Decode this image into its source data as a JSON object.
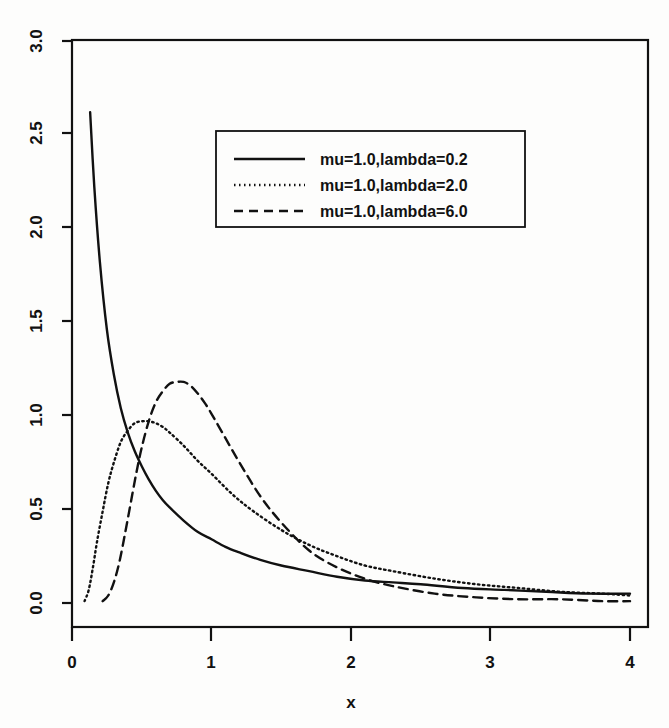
{
  "chart_data": {
    "type": "line",
    "title": "",
    "xlabel": "x",
    "ylabel": "",
    "xlim": [
      0,
      4
    ],
    "ylim": [
      0,
      3.0
    ],
    "grid": false,
    "legend_position": "top-center",
    "x_ticks": [
      "0",
      "1",
      "2",
      "3",
      "4"
    ],
    "x_tick_values": [
      0,
      1,
      2,
      3,
      4
    ],
    "y_ticks": [
      "0.0",
      "0.5",
      "1.0",
      "1.5",
      "2.0",
      "2.5",
      "3.0"
    ],
    "y_tick_values": [
      0.0,
      0.5,
      1.0,
      1.5,
      2.0,
      2.5,
      3.0
    ],
    "series": [
      {
        "name": "mu=1.0,lambda=0.2",
        "linestyle": "solid",
        "color": "#111111",
        "x": [
          0.13,
          0.16,
          0.2,
          0.25,
          0.3,
          0.35,
          0.4,
          0.45,
          0.5,
          0.55,
          0.6,
          0.65,
          0.7,
          0.8,
          0.9,
          1.0,
          1.1,
          1.2,
          1.35,
          1.5,
          1.7,
          1.9,
          2.1,
          2.3,
          2.5,
          2.8,
          3.1,
          3.4,
          3.7,
          4.0
        ],
        "y": [
          2.62,
          2.22,
          1.82,
          1.46,
          1.22,
          1.04,
          0.91,
          0.81,
          0.73,
          0.66,
          0.6,
          0.55,
          0.51,
          0.44,
          0.38,
          0.34,
          0.3,
          0.27,
          0.23,
          0.2,
          0.17,
          0.14,
          0.12,
          0.11,
          0.1,
          0.08,
          0.07,
          0.06,
          0.05,
          0.05
        ]
      },
      {
        "name": "mu=1.0,lambda=2.0",
        "linestyle": "dotted",
        "color": "#111111",
        "x": [
          0.09,
          0.12,
          0.15,
          0.18,
          0.22,
          0.26,
          0.3,
          0.35,
          0.4,
          0.45,
          0.5,
          0.55,
          0.6,
          0.65,
          0.7,
          0.8,
          0.9,
          1.0,
          1.15,
          1.3,
          1.5,
          1.7,
          1.9,
          2.1,
          2.3,
          2.6,
          2.9,
          3.2,
          3.5,
          3.8,
          4.0
        ],
        "y": [
          0.01,
          0.07,
          0.19,
          0.33,
          0.49,
          0.64,
          0.75,
          0.86,
          0.92,
          0.96,
          0.97,
          0.97,
          0.96,
          0.94,
          0.91,
          0.84,
          0.76,
          0.69,
          0.58,
          0.49,
          0.39,
          0.31,
          0.25,
          0.2,
          0.17,
          0.13,
          0.1,
          0.08,
          0.06,
          0.05,
          0.04
        ]
      },
      {
        "name": "mu=1.0,lambda=6.0",
        "linestyle": "dashed",
        "color": "#111111",
        "x": [
          0.22,
          0.26,
          0.3,
          0.34,
          0.38,
          0.42,
          0.46,
          0.5,
          0.55,
          0.6,
          0.65,
          0.7,
          0.75,
          0.8,
          0.85,
          0.9,
          0.95,
          1.0,
          1.1,
          1.2,
          1.35,
          1.5,
          1.7,
          1.9,
          2.1,
          2.3,
          2.6,
          2.9,
          3.2,
          3.5,
          3.8,
          4.0
        ],
        "y": [
          0.01,
          0.04,
          0.11,
          0.22,
          0.37,
          0.53,
          0.69,
          0.83,
          0.97,
          1.07,
          1.13,
          1.17,
          1.18,
          1.18,
          1.16,
          1.12,
          1.07,
          1.01,
          0.88,
          0.75,
          0.57,
          0.43,
          0.28,
          0.19,
          0.13,
          0.09,
          0.05,
          0.03,
          0.02,
          0.02,
          0.01,
          0.01
        ]
      }
    ],
    "legend_entries": [
      "mu=1.0,lambda=0.2",
      "mu=1.0,lambda=2.0",
      "mu=1.0,lambda=6.0"
    ]
  },
  "colors": {
    "ink": "#111111",
    "page_background": "#fdfdfc"
  }
}
